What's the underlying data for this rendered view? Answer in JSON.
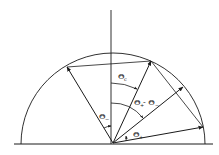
{
  "diagram": {
    "type": "geometric-angle-diagram",
    "colors": {
      "line": "#1a1a1a",
      "background": "#ffffff"
    },
    "labels": {
      "theta_c": {
        "symbol": "Θ",
        "subscript": "c"
      },
      "theta_diff": {
        "symbol": "Θ",
        "subscript": "+",
        "minus": "- Θ",
        "subscript2": "−"
      },
      "theta_minus": {
        "symbol": "Θ",
        "subscript": "−"
      },
      "theta_plus": {
        "symbol": "Θ",
        "subscript": "+"
      }
    }
  }
}
